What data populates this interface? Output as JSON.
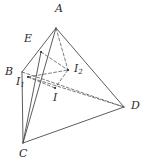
{
  "figure": {
    "width": 147,
    "height": 167,
    "background_color": "#ffffff",
    "stroke_color": "#4a4a4a",
    "label_color": "#2b2b2b",
    "solid_stroke_width": 0.9,
    "dashed_stroke_width": 0.8,
    "dash_pattern": "3,2.2"
  },
  "labels": {
    "A": {
      "text": "A",
      "sub": "",
      "x": 55,
      "y": 3
    },
    "E": {
      "text": "E",
      "sub": "",
      "x": 24,
      "y": 33
    },
    "B": {
      "text": "B",
      "sub": "",
      "x": 5,
      "y": 66
    },
    "I1": {
      "text": "I",
      "sub": "1",
      "x": 16,
      "y": 76
    },
    "I2": {
      "text": "I",
      "sub": "2",
      "x": 74,
      "y": 63
    },
    "I": {
      "text": "I",
      "sub": "",
      "x": 53,
      "y": 92
    },
    "D": {
      "text": "D",
      "sub": "",
      "x": 131,
      "y": 100
    },
    "C": {
      "text": "C",
      "sub": "",
      "x": 19,
      "y": 148
    }
  },
  "vertices": {
    "A": {
      "x": 56,
      "y": 28
    },
    "B": {
      "x": 22,
      "y": 72
    },
    "C": {
      "x": 23,
      "y": 143
    },
    "D": {
      "x": 124,
      "y": 107
    },
    "E": {
      "x": 41,
      "y": 52
    },
    "I": {
      "x": 55,
      "y": 88
    },
    "I1": {
      "x": 28,
      "y": 77
    },
    "I2": {
      "x": 68,
      "y": 70
    }
  },
  "solid_edges": [
    {
      "name": "edge-A-B",
      "from": "A",
      "to": "B"
    },
    {
      "name": "edge-A-C",
      "from": "A",
      "to": "C"
    },
    {
      "name": "edge-A-D",
      "from": "A",
      "to": "D"
    },
    {
      "name": "edge-B-C",
      "from": "B",
      "to": "C"
    },
    {
      "name": "edge-C-D",
      "from": "C",
      "to": "D"
    },
    {
      "name": "edge-E-C",
      "from": "E",
      "to": "C"
    }
  ],
  "dashed_edges": [
    {
      "name": "edge-B-D",
      "from": "B",
      "to": "D"
    },
    {
      "name": "edge-I1-D",
      "from": "I1",
      "to": "D"
    },
    {
      "name": "edge-A-I2",
      "from": "A",
      "to": "I2"
    },
    {
      "name": "edge-I1-I2",
      "from": "I1",
      "to": "I2"
    },
    {
      "name": "edge-I2-I",
      "from": "I2",
      "to": "I"
    },
    {
      "name": "edge-E-I2",
      "from": "E",
      "to": "I2"
    },
    {
      "name": "edge-I1-I",
      "from": "I1",
      "to": "I"
    }
  ],
  "point_markers": [
    {
      "name": "point-marker-E",
      "at": "E"
    },
    {
      "name": "point-marker-I",
      "at": "I"
    },
    {
      "name": "point-marker-I1",
      "at": "I1"
    },
    {
      "name": "point-marker-I2",
      "at": "I2"
    }
  ]
}
